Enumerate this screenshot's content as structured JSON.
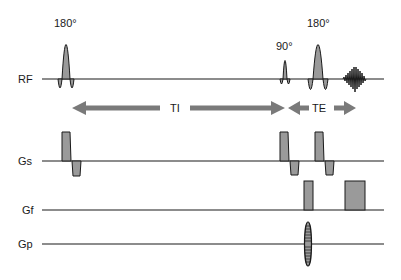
{
  "diagram": {
    "colors": {
      "line": "#1a1a1a",
      "fill": "#9a9a9a",
      "arrow": "#7a7a7a",
      "background": "#ffffff"
    },
    "channels": [
      {
        "id": "rf",
        "label": "RF",
        "baseline_y": 79
      },
      {
        "id": "gs",
        "label": "Gs",
        "baseline_y": 161
      },
      {
        "id": "gf",
        "label": "Gf",
        "baseline_y": 210
      },
      {
        "id": "gp",
        "label": "Gp",
        "baseline_y": 244
      }
    ],
    "rf_pulses": [
      {
        "name": "inversion-pulse",
        "label": "180°",
        "center_x": 66,
        "amplitude": 46
      },
      {
        "name": "excitation-pulse",
        "label": "90°",
        "center_x": 285,
        "amplitude": 24
      },
      {
        "name": "refocusing-pulse",
        "label": "180°",
        "center_x": 318,
        "amplitude": 46
      }
    ],
    "echo": {
      "name": "echo-signal",
      "center_x": 355
    },
    "intervals": [
      {
        "name": "TI",
        "label": "TI",
        "from_x": 72,
        "to_x": 285
      },
      {
        "name": "TE",
        "label": "TE",
        "from_x": 288,
        "to_x": 356
      }
    ],
    "gradients": {
      "gs": [
        {
          "x": 62,
          "w": 9,
          "pos_h": 29,
          "neg_w": 9,
          "neg_h": 14
        },
        {
          "x": 280,
          "w": 9,
          "pos_h": 29,
          "neg_w": 9,
          "neg_h": 14
        },
        {
          "x": 315,
          "w": 9,
          "pos_h": 29,
          "neg_w": 9,
          "neg_h": 14
        }
      ],
      "gf": [
        {
          "name": "dephase-lobe",
          "x": 304,
          "w": 9,
          "h": 29
        },
        {
          "name": "readout-lobe",
          "x": 345,
          "w": 20,
          "h": 29
        }
      ],
      "gp": {
        "name": "phase-encode-table",
        "center_x": 308,
        "half_height": 22
      }
    }
  }
}
